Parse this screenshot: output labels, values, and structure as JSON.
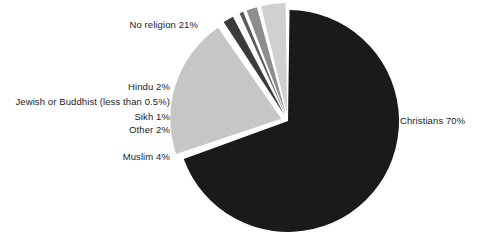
{
  "chart_data": {
    "type": "pie",
    "title": "",
    "subtitle": "",
    "xlabel": "",
    "ylabel": "",
    "legend_position": "none",
    "grid": false,
    "categories": [
      "Christians",
      "No religion",
      "Hindu",
      "Jewish or Buddhist",
      "Sikh",
      "Other",
      "Muslim"
    ],
    "values": [
      70,
      21,
      2,
      0.5,
      1,
      2,
      4
    ],
    "labels": [
      "Christians 70%",
      "No religion 21%",
      "Hindu 2%",
      "Jewish or Buddhist (less than 0.5%)",
      "Sikh 1%",
      "Other 2%",
      "Muslim 4%"
    ],
    "value_texts": [
      "70%",
      "21%",
      "2%",
      "less than 0.5%",
      "1%",
      "2%",
      "4%"
    ],
    "colors": [
      "#1a1a1a",
      "#c6c6c6",
      "#3a3a3a",
      "#d9d9d9",
      "#5a5a5a",
      "#8d8d8d",
      "#d0d0d0"
    ],
    "slice_gap_color": "#ffffff",
    "start_angle_deg": -90,
    "direction": "clockwise",
    "exploded": true
  },
  "figure": {
    "background": "#ffffff",
    "text_color": "#1b1b1b"
  },
  "labels": {
    "christians": "Christians 70%",
    "no_religion": "No religion 21%",
    "hindu": "Hindu 2%",
    "jewish_buddhist": "Jewish or Buddhist (less than 0.5%)",
    "sikh": "Sikh 1%",
    "other": "Other 2%",
    "muslim": "Muslim 4%"
  }
}
